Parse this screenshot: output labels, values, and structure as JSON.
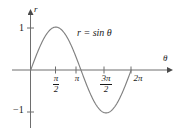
{
  "figure": {
    "background_color": "#ffffff",
    "curve_color": "#808080",
    "axis_color": "#6e6e6e",
    "text_color": "#1a1a1a"
  },
  "axes": {
    "x_axis_label": "θ",
    "y_axis_label": "r",
    "x_ticks": [
      {
        "name": "pi-half",
        "numerator": "π",
        "denominator": "2",
        "value": 1.5708
      },
      {
        "name": "pi",
        "label": "π",
        "value": 3.1416
      },
      {
        "name": "3pi-half",
        "numerator": "3π",
        "denominator": "2",
        "value": 4.7124
      },
      {
        "name": "2pi",
        "label": "2π",
        "value": 6.2832
      }
    ],
    "y_ticks": [
      {
        "name": "one",
        "label": "1",
        "value": 1
      },
      {
        "name": "neg-one",
        "label": "−1",
        "value": -1
      }
    ]
  },
  "annotations": {
    "equation": "r = sin θ"
  },
  "chart_data": {
    "type": "line",
    "title": "",
    "xlabel": "θ",
    "ylabel": "r",
    "xlim": [
      -0.45,
      7.6
    ],
    "ylim": [
      -1.45,
      1.45
    ],
    "grid": false,
    "legend": null,
    "xtick_values": [
      1.5708,
      3.1416,
      4.7124,
      6.2832
    ],
    "xtick_labels": [
      "π/2",
      "π",
      "3π/2",
      "2π"
    ],
    "ytick_values": [
      1,
      -1
    ],
    "ytick_labels": [
      "1",
      "−1"
    ],
    "series": [
      {
        "name": "r = sin θ",
        "equation": "r = sin(theta)",
        "x": [
          0,
          0.3927,
          0.7854,
          1.1781,
          1.5708,
          1.9635,
          2.3562,
          2.7489,
          3.1416,
          3.5343,
          3.927,
          4.3197,
          4.7124,
          5.1051,
          5.4978,
          5.8905,
          6.2832
        ],
        "y": [
          0,
          0.3827,
          0.7071,
          0.9239,
          1,
          0.9239,
          0.7071,
          0.3827,
          0,
          -0.3827,
          -0.7071,
          -0.9239,
          -1,
          -0.9239,
          -0.7071,
          -0.3827,
          0
        ]
      }
    ],
    "annotations": [
      {
        "text": "r = sin θ",
        "x": 3.5,
        "y": 0.82
      }
    ]
  }
}
